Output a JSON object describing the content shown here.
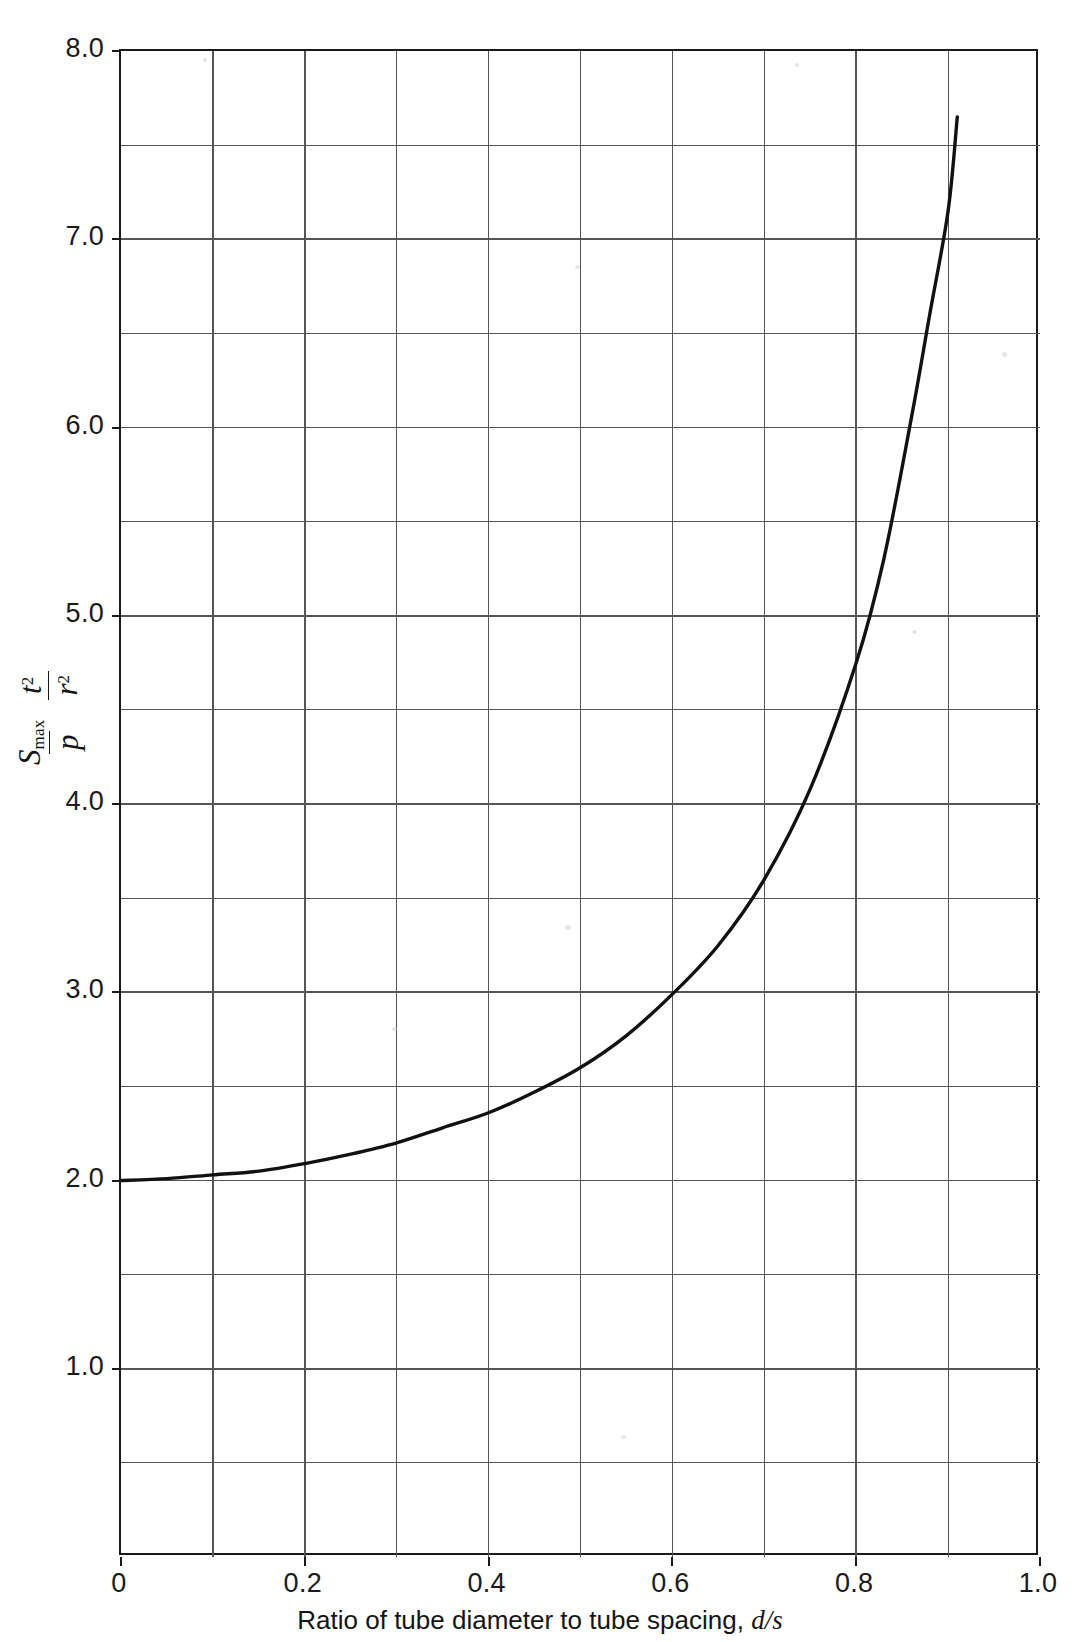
{
  "figure": {
    "background": "#ffffff",
    "axis_color": "#1a1a1a",
    "grid_color": "#555555",
    "curve_color": "#111111"
  },
  "axes": {
    "y_title": {
      "num1": "S",
      "num1_sub": "max",
      "den1": "p",
      "num2": "t",
      "num2_sup": "2",
      "den2": "r",
      "den2_sup": "2"
    },
    "x_title_prefix": "Ratio of tube diameter to tube spacing,",
    "x_title_symbol": "d/s",
    "x_ticks": [
      "0",
      "0.2",
      "0.4",
      "0.6",
      "0.8",
      "1.0"
    ],
    "y_ticks": [
      "1.0",
      "2.0",
      "3.0",
      "4.0",
      "5.0",
      "6.0",
      "7.0",
      "8.0"
    ]
  },
  "chart_data": {
    "type": "line",
    "title": "",
    "subtitle": "",
    "xlabel": "Ratio of tube diameter to tube spacing, d/s",
    "ylabel": "S_max/p · t^2/r^2",
    "xlim": [
      0,
      1.0
    ],
    "ylim": [
      0,
      8.0
    ],
    "x_major_ticks": [
      0,
      0.2,
      0.4,
      0.6,
      0.8,
      1.0
    ],
    "y_major_ticks": [
      1.0,
      2.0,
      3.0,
      4.0,
      5.0,
      6.0,
      7.0,
      8.0
    ],
    "x_minor_step": 0.1,
    "y_minor_step": 0.5,
    "grid": true,
    "legend": "none",
    "series": [
      {
        "name": "Smax t^2 / (p r^2)",
        "x": [
          0.0,
          0.05,
          0.1,
          0.15,
          0.2,
          0.25,
          0.3,
          0.35,
          0.4,
          0.45,
          0.5,
          0.55,
          0.6,
          0.65,
          0.7,
          0.75,
          0.8,
          0.83,
          0.86,
          0.88,
          0.9,
          0.91
        ],
        "y": [
          2.0,
          2.01,
          2.03,
          2.05,
          2.09,
          2.14,
          2.2,
          2.28,
          2.36,
          2.47,
          2.6,
          2.77,
          2.99,
          3.25,
          3.6,
          4.08,
          4.75,
          5.3,
          6.05,
          6.6,
          7.15,
          7.65
        ]
      }
    ],
    "annotations": []
  }
}
